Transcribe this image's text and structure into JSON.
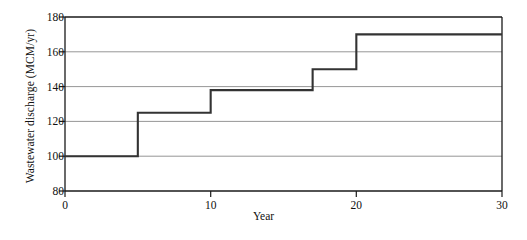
{
  "chart_data": {
    "type": "line",
    "subtype": "step",
    "title": "",
    "xlabel": "Year",
    "ylabel": "Wastewater discharge (MCM/yr)",
    "xlim": [
      0,
      30
    ],
    "ylim": [
      80,
      180
    ],
    "xticks": [
      0,
      10,
      20,
      30
    ],
    "yticks": [
      80,
      100,
      120,
      140,
      160,
      180
    ],
    "xtick_labels": [
      "0",
      "10",
      "20",
      "30"
    ],
    "ytick_labels": [
      "80",
      "100",
      "120",
      "140",
      "160",
      "180"
    ],
    "grid": "horizontal",
    "legend": "none",
    "series": [
      {
        "name": "Wastewater discharge",
        "color": "#333333",
        "step_mode": "post",
        "x": [
          0,
          5,
          10,
          17,
          20,
          30
        ],
        "y": [
          100,
          125,
          138,
          150,
          170,
          170
        ],
        "segments": [
          {
            "x_start": 0,
            "x_end": 5,
            "value": 100
          },
          {
            "x_start": 5,
            "x_end": 10,
            "value": 125
          },
          {
            "x_start": 10,
            "x_end": 17,
            "value": 138
          },
          {
            "x_start": 17,
            "x_end": 20,
            "value": 150
          },
          {
            "x_start": 20,
            "x_end": 30,
            "value": 170
          }
        ]
      }
    ],
    "axis_color": "#1a1a1a",
    "grid_color": "#8a8a8a",
    "background": "#ffffff"
  }
}
